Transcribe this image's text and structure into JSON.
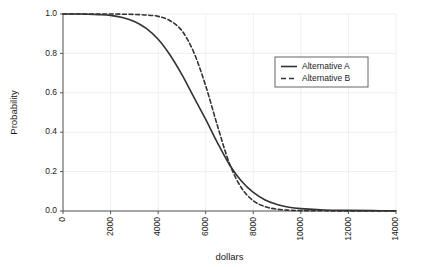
{
  "chart_data": {
    "type": "line",
    "title": "",
    "subtitle": "",
    "xlabel": "dollars",
    "ylabel": "Probability",
    "xlim": [
      0,
      14000
    ],
    "ylim": [
      0.0,
      1.0
    ],
    "xticks": [
      0,
      2000,
      4000,
      6000,
      8000,
      10000,
      12000,
      14000
    ],
    "xticklabels": [
      "0",
      "2000",
      "4000",
      "6000",
      "8000",
      "10000",
      "12000",
      "14000"
    ],
    "yticks": [
      0.0,
      0.2,
      0.4,
      0.6,
      0.8,
      1.0
    ],
    "yticklabels": [
      "0.0",
      "0.2",
      "0.4",
      "0.6",
      "0.8",
      "1.0"
    ],
    "xtick_label_rotation": 90,
    "grid": true,
    "grid_color": "#e8e8e8",
    "legend_position": "upper right",
    "series": [
      {
        "name": "Alternative A",
        "style": "solid",
        "color": "#333333",
        "x": [
          0,
          500,
          1000,
          1500,
          2000,
          2500,
          3000,
          3500,
          4000,
          4500,
          5000,
          5500,
          6000,
          6500,
          7000,
          7500,
          8000,
          8500,
          9000,
          9500,
          10000,
          11000,
          12000,
          13000,
          14000
        ],
        "values": [
          1.0,
          1.0,
          0.999,
          0.997,
          0.993,
          0.982,
          0.962,
          0.927,
          0.872,
          0.792,
          0.692,
          0.578,
          0.465,
          0.345,
          0.235,
          0.152,
          0.094,
          0.056,
          0.033,
          0.019,
          0.012,
          0.005,
          0.003,
          0.002,
          0.001
        ]
      },
      {
        "name": "Alternative B",
        "style": "dashed",
        "color": "#333333",
        "x": [
          0,
          500,
          1000,
          1500,
          2000,
          2500,
          3000,
          3500,
          4000,
          4500,
          5000,
          5500,
          6000,
          6500,
          7000,
          7500,
          8000,
          8500,
          9000,
          9500,
          10000,
          11000,
          12000,
          13000,
          14000
        ],
        "values": [
          1.0,
          1.0,
          1.0,
          1.0,
          1.0,
          0.999,
          0.998,
          0.995,
          0.988,
          0.966,
          0.915,
          0.805,
          0.635,
          0.43,
          0.24,
          0.118,
          0.052,
          0.022,
          0.009,
          0.004,
          0.002,
          0.001,
          0.0,
          0.0,
          0.0
        ]
      }
    ],
    "annotations": {
      "crossing_point": {
        "x": 7000,
        "y": 0.22
      }
    }
  },
  "legend": {
    "items": [
      {
        "label": "Alternative A",
        "style": "solid"
      },
      {
        "label": "Alternative B",
        "style": "dashed"
      }
    ]
  }
}
